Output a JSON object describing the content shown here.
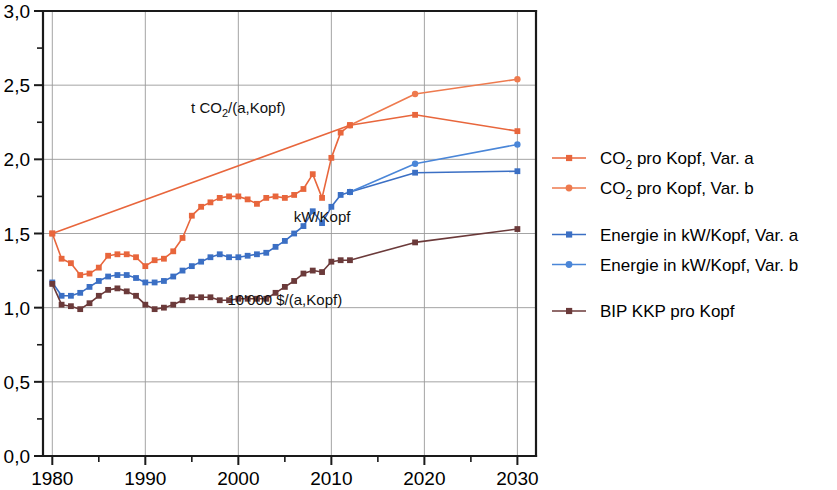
{
  "chart_data": {
    "type": "line",
    "title": "",
    "xlabel": "",
    "ylabel": "",
    "xlim": [
      1979,
      2032
    ],
    "ylim": [
      0.0,
      3.0
    ],
    "grid": true,
    "legend_position": "right",
    "y_ticks": [
      "0,0",
      "0,5",
      "1,0",
      "1,5",
      "2,0",
      "2,5",
      "3,0"
    ],
    "y_tick_values": [
      0.0,
      0.5,
      1.0,
      1.5,
      2.0,
      2.5,
      3.0
    ],
    "y_minor_tick_values": [
      0.25,
      0.75,
      1.25,
      1.75,
      2.25,
      2.75
    ],
    "x_ticks": [
      "1980",
      "1990",
      "2000",
      "2010",
      "2020",
      "2030"
    ],
    "x_tick_values": [
      1980,
      1990,
      2000,
      2010,
      2020,
      2030
    ],
    "x_minor_tick_values": [
      1985,
      1995,
      2005,
      2015,
      2025
    ],
    "decimal_separator": ",",
    "series": [
      {
        "name": "CO2 pro Kopf, Var. a",
        "color": "#e8663c",
        "marker": "square",
        "x": [
          1980,
          2012,
          2019,
          2030
        ],
        "values": [
          1.5,
          2.23,
          2.3,
          2.19
        ]
      },
      {
        "name": "CO2 pro Kopf, Var. b",
        "color": "#ee7a4e",
        "marker": "circle",
        "x": [
          2012,
          2019,
          2030
        ],
        "values": [
          2.23,
          2.44,
          2.54
        ]
      },
      {
        "name": "CO2 historisch",
        "color": "#e8663c",
        "marker": "square",
        "x": [
          1980,
          1981,
          1982,
          1983,
          1984,
          1985,
          1986,
          1987,
          1988,
          1989,
          1990,
          1991,
          1992,
          1993,
          1994,
          1995,
          1996,
          1997,
          1998,
          1999,
          2000,
          2001,
          2002,
          2003,
          2004,
          2005,
          2006,
          2007,
          2008,
          2009,
          2010,
          2011,
          2012
        ],
        "values": [
          1.5,
          1.33,
          1.3,
          1.22,
          1.23,
          1.27,
          1.35,
          1.36,
          1.36,
          1.34,
          1.28,
          1.32,
          1.33,
          1.38,
          1.47,
          1.62,
          1.68,
          1.71,
          1.74,
          1.75,
          1.75,
          1.73,
          1.7,
          1.74,
          1.75,
          1.74,
          1.76,
          1.8,
          1.9,
          1.74,
          2.01,
          2.18,
          2.23
        ]
      },
      {
        "name": "Energie in kW/Kopf, Var. a",
        "color": "#3b6fc4",
        "marker": "square",
        "x": [
          2012,
          2019,
          2030
        ],
        "values": [
          1.78,
          1.91,
          1.92
        ]
      },
      {
        "name": "Energie in kW/Kopf, Var. b",
        "color": "#4a86d8",
        "marker": "circle",
        "x": [
          2012,
          2019,
          2030
        ],
        "values": [
          1.78,
          1.97,
          2.1
        ]
      },
      {
        "name": "Energie historisch",
        "color": "#3b6fc4",
        "marker": "square",
        "x": [
          1980,
          1981,
          1982,
          1983,
          1984,
          1985,
          1986,
          1987,
          1988,
          1989,
          1990,
          1991,
          1992,
          1993,
          1994,
          1995,
          1996,
          1997,
          1998,
          1999,
          2000,
          2001,
          2002,
          2003,
          2004,
          2005,
          2006,
          2007,
          2008,
          2009,
          2010,
          2011,
          2012
        ],
        "values": [
          1.17,
          1.08,
          1.08,
          1.1,
          1.14,
          1.18,
          1.21,
          1.22,
          1.22,
          1.2,
          1.17,
          1.17,
          1.18,
          1.21,
          1.25,
          1.28,
          1.31,
          1.34,
          1.36,
          1.34,
          1.34,
          1.35,
          1.36,
          1.37,
          1.41,
          1.45,
          1.5,
          1.55,
          1.65,
          1.57,
          1.68,
          1.76,
          1.78
        ]
      },
      {
        "name": "BIP KKP pro Kopf",
        "color": "#6b3a3a",
        "marker": "square",
        "x": [
          1980,
          1981,
          1982,
          1983,
          1984,
          1985,
          1986,
          1987,
          1988,
          1989,
          1990,
          1991,
          1992,
          1993,
          1994,
          1995,
          1996,
          1997,
          1998,
          1999,
          2000,
          2001,
          2002,
          2003,
          2004,
          2005,
          2006,
          2007,
          2008,
          2009,
          2010,
          2011,
          2012,
          2019,
          2030
        ],
        "values": [
          1.16,
          1.02,
          1.01,
          0.99,
          1.03,
          1.08,
          1.12,
          1.13,
          1.11,
          1.08,
          1.02,
          0.99,
          1.0,
          1.02,
          1.05,
          1.07,
          1.07,
          1.07,
          1.05,
          1.05,
          1.06,
          1.06,
          1.06,
          1.06,
          1.1,
          1.14,
          1.18,
          1.23,
          1.25,
          1.24,
          1.31,
          1.32,
          1.32,
          1.44,
          1.53
        ]
      }
    ],
    "annotations": [
      {
        "id": "co2-annotation",
        "text_before": "t CO",
        "text_sub": "2",
        "text_after": "/(a,Kopf)",
        "x": 2000,
        "y": 2.31
      },
      {
        "id": "energy-annotation",
        "text_before": "kW/Kopf",
        "text_sub": "",
        "text_after": "",
        "x": 2009,
        "y": 1.58
      },
      {
        "id": "gdp-annotation",
        "text_before": "10'000 $/(a,Kopf)",
        "text_sub": "",
        "text_after": "",
        "x": 2005,
        "y": 1.02
      }
    ],
    "legend": [
      {
        "label_before": "CO",
        "label_sub": "2",
        "label_after": " pro Kopf, Var. a",
        "color": "#e8663c",
        "marker": "square"
      },
      {
        "label_before": "CO",
        "label_sub": "2",
        "label_after": " pro Kopf, Var. b",
        "color": "#ee7a4e",
        "marker": "circle"
      },
      {
        "label_before": "Energie in kW/Kopf, Var. a",
        "label_sub": "",
        "label_after": "",
        "color": "#3b6fc4",
        "marker": "square"
      },
      {
        "label_before": "Energie in kW/Kopf, Var. b",
        "label_sub": "",
        "label_after": "",
        "color": "#4a86d8",
        "marker": "circle"
      },
      {
        "label_before": "BIP KKP pro Kopf",
        "label_sub": "",
        "label_after": "",
        "color": "#6b3a3a",
        "marker": "square"
      }
    ]
  }
}
